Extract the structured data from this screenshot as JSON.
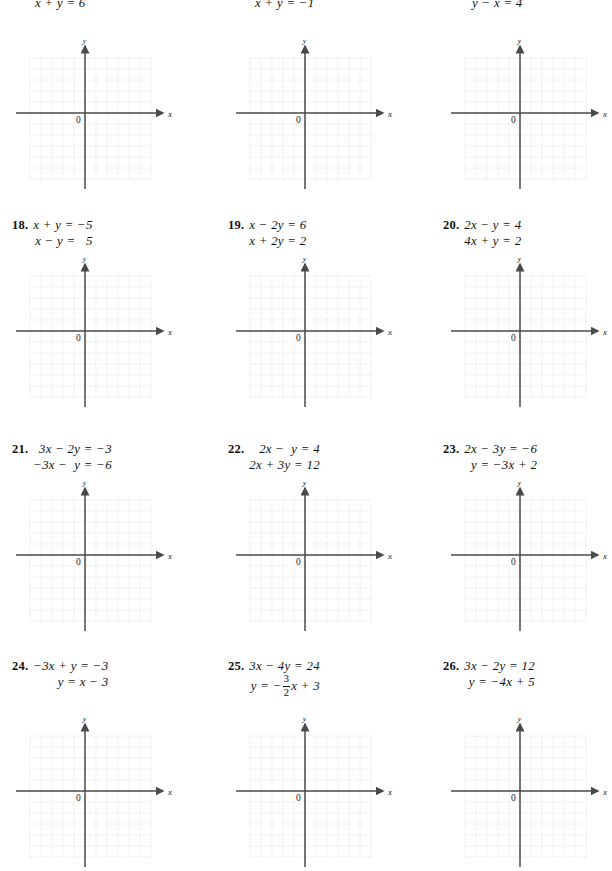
{
  "page": {
    "type": "math-textbook-exercise-page",
    "width": 600,
    "height": 863
  },
  "grid": {
    "axis_label_x": "x",
    "axis_label_y": "y",
    "origin_label": "0",
    "cols": 11,
    "rows": 11,
    "cell_px": 11,
    "grid_color": "#d9d9d9",
    "axis_color": "#4a4a4a"
  },
  "rows": [
    {
      "id": "row-top-partial",
      "problems": [
        {
          "id": "p-top-1",
          "number": "",
          "equations": [
            "x + y = 6"
          ],
          "align": "left"
        },
        {
          "id": "p-top-2",
          "number": "",
          "equations": [
            "x + y = −1"
          ],
          "align": "left"
        },
        {
          "id": "p-top-3",
          "number": "",
          "equations": [
            "y − x = 4"
          ],
          "align": "left"
        }
      ]
    },
    {
      "id": "row-18-20",
      "problems": [
        {
          "id": "p18",
          "number": "18.",
          "equations": [
            "x + y = −5",
            "x − y =   5"
          ],
          "align": "right"
        },
        {
          "id": "p19",
          "number": "19.",
          "equations": [
            "x − 2y = 6",
            "x + 2y = 2"
          ],
          "align": "right"
        },
        {
          "id": "p20",
          "number": "20.",
          "equations": [
            "2x − y = 4",
            "4x + y = 2"
          ],
          "align": "right"
        }
      ]
    },
    {
      "id": "row-21-23",
      "problems": [
        {
          "id": "p21",
          "number": "21.",
          "equations": [
            "3x − 2y = −3",
            "−3x −  y = −6"
          ],
          "align": "right"
        },
        {
          "id": "p22",
          "number": "22.",
          "equations": [
            "2x −  y = 4",
            "2x + 3y = 12"
          ],
          "align": "right"
        },
        {
          "id": "p23",
          "number": "23.",
          "equations": [
            "2x − 3y = −6",
            "y = −3x + 2"
          ],
          "align": "right"
        }
      ]
    },
    {
      "id": "row-24-26",
      "problems": [
        {
          "id": "p24",
          "number": "24.",
          "equations": [
            "−3x + y = −3",
            "y = x − 3"
          ],
          "align": "right"
        },
        {
          "id": "p25",
          "number": "25.",
          "equations": [
            "3x − 4y = 24"
          ],
          "fraction_equation": {
            "prefix": "y = −",
            "numerator": "3",
            "denominator": "2",
            "suffix": "x + 3"
          },
          "align": "right"
        },
        {
          "id": "p26",
          "number": "26.",
          "equations": [
            "3x − 2y = 12",
            "y = −4x + 5"
          ],
          "align": "right"
        }
      ]
    }
  ]
}
